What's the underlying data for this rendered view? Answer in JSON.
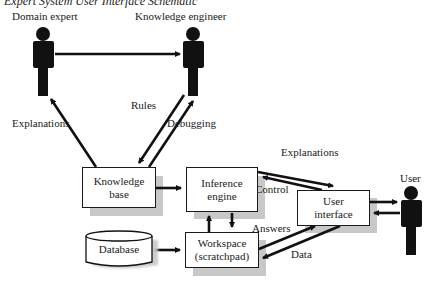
{
  "title": "Expert System User Interface Schematic",
  "actors": {
    "domain_expert": "Domain expert",
    "knowledge_engineer": "Knowledge engineer",
    "user": "User"
  },
  "components": {
    "knowledge_base": {
      "line1": "Knowledge",
      "line2": "base"
    },
    "inference_engine": {
      "line1": "Inference",
      "line2": "engine"
    },
    "user_interface": {
      "line1": "User",
      "line2": "interface"
    },
    "workspace": {
      "line1": "Workspace",
      "line2": "(scratchpad)"
    },
    "database": "Database"
  },
  "edge_labels": {
    "explanations_left": "Explanations",
    "rules": "Rules",
    "debugging": "Debugging",
    "explanations_right": "Explanations",
    "control": "Control",
    "answers": "Answers",
    "data": "Data"
  },
  "colors": {
    "stroke": "#111111",
    "shadow": "#c8c8c8",
    "background": "#ffffff"
  }
}
